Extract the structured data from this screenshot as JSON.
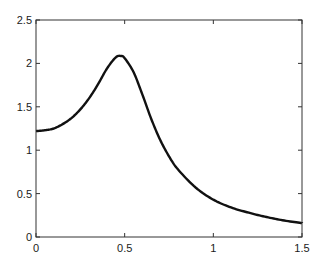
{
  "chart_data": {
    "type": "line",
    "title": "",
    "xlabel": "",
    "ylabel": "",
    "xlim": [
      0,
      1.5
    ],
    "ylim": [
      0,
      2.5
    ],
    "grid": false,
    "legend": null,
    "x_ticks": [
      "0",
      "0.5",
      "1",
      "1.5"
    ],
    "y_ticks": [
      "0",
      "0.5",
      "1",
      "1.5",
      "2",
      "2.5"
    ],
    "series": [
      {
        "name": "response",
        "color": "#111111",
        "x": [
          0,
          0.05,
          0.1,
          0.15,
          0.2,
          0.25,
          0.3,
          0.35,
          0.4,
          0.45,
          0.48,
          0.5,
          0.55,
          0.6,
          0.65,
          0.7,
          0.75,
          0.8,
          0.9,
          1.0,
          1.1,
          1.2,
          1.3,
          1.4,
          1.5
        ],
        "y": [
          1.22,
          1.23,
          1.25,
          1.3,
          1.37,
          1.47,
          1.6,
          1.76,
          1.94,
          2.07,
          2.085,
          2.06,
          1.9,
          1.64,
          1.36,
          1.12,
          0.93,
          0.78,
          0.57,
          0.43,
          0.34,
          0.28,
          0.23,
          0.19,
          0.16
        ]
      }
    ]
  }
}
